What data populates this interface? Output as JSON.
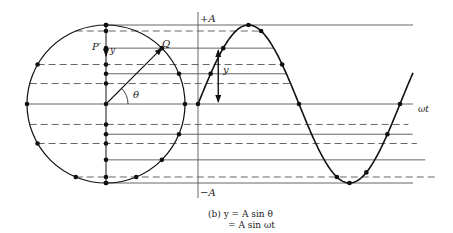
{
  "figure": {
    "caption_line1": "(b)  y = A sin θ",
    "caption_line2": "= A sin ωt",
    "colors": {
      "ink": "#111111",
      "guide": "#555555",
      "background": "#ffffff"
    }
  },
  "labels": {
    "plus_amplitude": "+A",
    "minus_amplitude": "−A",
    "x_axis": "ωt",
    "point_p_prime": "P′",
    "point_q": "Q",
    "angle": "θ",
    "y_on_circle": "y",
    "y_on_wave": "y"
  },
  "geometry": {
    "circle": {
      "cx": 106,
      "cy": 104,
      "r": 79
    },
    "axis_x": 198,
    "baseline_y": 104,
    "top_y": 25,
    "bottom_y": 183,
    "wave": {
      "start_x": 198,
      "period_px": 202,
      "amplitude_px": 79,
      "end_x": 413
    },
    "levels": [
      {
        "angle_deg": 90,
        "style": "solid"
      },
      {
        "angle_deg": 67.5,
        "style": "dashed"
      },
      {
        "angle_deg": 45,
        "style": "solid"
      },
      {
        "angle_deg": 30,
        "style": "dashed"
      },
      {
        "angle_deg": 22.5,
        "style": "solid"
      },
      {
        "angle_deg": 15,
        "style": "dashed"
      },
      {
        "angle_deg": 0,
        "style": "solid"
      }
    ]
  }
}
